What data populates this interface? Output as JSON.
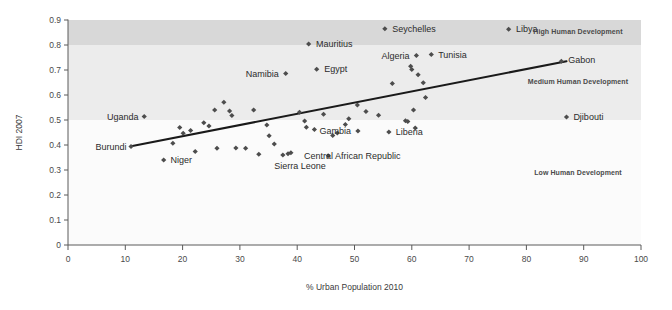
{
  "chart_data": {
    "type": "scatter",
    "title": "",
    "xlabel": "% Urban Population 2010",
    "ylabel": "HDI 2007",
    "xlim": [
      0,
      100
    ],
    "ylim": [
      0,
      0.9
    ],
    "xticks": [
      "0",
      "10",
      "20",
      "30",
      "40",
      "50",
      "60",
      "70",
      "80",
      "90",
      "100"
    ],
    "yticks": [
      "0",
      "0.1",
      "0.2",
      "0.3",
      "0.4",
      "0.5",
      "0.6",
      "0.7",
      "0.8",
      "0.9"
    ],
    "grid": false,
    "legend": "none",
    "marker_color": "#4d4d4d",
    "trendline_color": "#1a1a1a",
    "bands": [
      {
        "name": "High Human Development",
        "label": "High Human Development",
        "y_from": 0.8,
        "y_to": 0.9,
        "color": "#d8d8d8",
        "label_x": 89,
        "label_y": 0.855
      },
      {
        "name": "Medium Human Development",
        "label": "Medium Human Development",
        "y_from": 0.5,
        "y_to": 0.8,
        "color": "#ececec",
        "label_x": 89,
        "label_y": 0.655
      },
      {
        "name": "Low Human Development",
        "label": "Low Human Development",
        "y_from": 0.0,
        "y_to": 0.5,
        "color": "#fbfbfb",
        "label_x": 89,
        "label_y": 0.29
      }
    ],
    "trendline": {
      "x1": 11,
      "y1": 0.395,
      "x2": 87,
      "y2": 0.735
    },
    "labeled_points": [
      {
        "name": "Burundi",
        "x": 11,
        "y": 0.394,
        "label": "Burundi",
        "lx": 10.2,
        "ly": 0.394,
        "anchor": "end"
      },
      {
        "name": "Uganda",
        "x": 13.3,
        "y": 0.514,
        "label": "Uganda",
        "lx": 12.3,
        "ly": 0.514,
        "anchor": "end"
      },
      {
        "name": "Niger",
        "x": 16.7,
        "y": 0.34,
        "label": "Niger",
        "lx": 17.9,
        "ly": 0.34,
        "anchor": "start"
      },
      {
        "name": "Sierra Leone",
        "x": 38.4,
        "y": 0.365,
        "label": "Sierra Leone",
        "lx": 40.5,
        "ly": 0.318,
        "anchor": "middle"
      },
      {
        "name": "Central African Republic",
        "x": 38.9,
        "y": 0.369,
        "label": "Central African Republic",
        "lx": 41.2,
        "ly": 0.356,
        "anchor": "start"
      },
      {
        "name": "Namibia",
        "x": 38.0,
        "y": 0.686,
        "label": "Namibia",
        "lx": 36.8,
        "ly": 0.686,
        "anchor": "end"
      },
      {
        "name": "Egypt",
        "x": 43.4,
        "y": 0.703,
        "label": "Egypt",
        "lx": 44.7,
        "ly": 0.703,
        "anchor": "start"
      },
      {
        "name": "Mauritius",
        "x": 42.0,
        "y": 0.804,
        "label": "Mauritius",
        "lx": 43.3,
        "ly": 0.804,
        "anchor": "start"
      },
      {
        "name": "Seychelles",
        "x": 55.3,
        "y": 0.865,
        "label": "Seychelles",
        "lx": 56.6,
        "ly": 0.865,
        "anchor": "start"
      },
      {
        "name": "Gambia",
        "x": 50.6,
        "y": 0.456,
        "label": "Gambia",
        "lx": 49.4,
        "ly": 0.456,
        "anchor": "end"
      },
      {
        "name": "Liberia",
        "x": 56.0,
        "y": 0.452,
        "label": "Liberia",
        "lx": 57.2,
        "ly": 0.452,
        "anchor": "start"
      },
      {
        "name": "Algeria",
        "x": 60.8,
        "y": 0.758,
        "label": "Algeria",
        "lx": 59.6,
        "ly": 0.758,
        "anchor": "end"
      },
      {
        "name": "Tunisia",
        "x": 63.4,
        "y": 0.762,
        "label": "Tunisia",
        "lx": 64.6,
        "ly": 0.762,
        "anchor": "start"
      },
      {
        "name": "Libya",
        "x": 76.9,
        "y": 0.863,
        "label": "Libya",
        "lx": 78.2,
        "ly": 0.863,
        "anchor": "start"
      },
      {
        "name": "Gabon",
        "x": 86.1,
        "y": 0.735,
        "label": "Gabon",
        "lx": 87.3,
        "ly": 0.742,
        "anchor": "start"
      },
      {
        "name": "Djibouti",
        "x": 87.0,
        "y": 0.512,
        "label": "Djibouti",
        "lx": 88.2,
        "ly": 0.512,
        "anchor": "start"
      }
    ],
    "unlabeled_points": [
      {
        "x": 18.3,
        "y": 0.407
      },
      {
        "x": 19.5,
        "y": 0.47
      },
      {
        "x": 20.1,
        "y": 0.447
      },
      {
        "x": 21.4,
        "y": 0.458
      },
      {
        "x": 22.2,
        "y": 0.374
      },
      {
        "x": 23.7,
        "y": 0.489
      },
      {
        "x": 24.6,
        "y": 0.476
      },
      {
        "x": 25.6,
        "y": 0.54
      },
      {
        "x": 26.0,
        "y": 0.387
      },
      {
        "x": 27.2,
        "y": 0.571
      },
      {
        "x": 28.2,
        "y": 0.536
      },
      {
        "x": 28.6,
        "y": 0.518
      },
      {
        "x": 29.3,
        "y": 0.388
      },
      {
        "x": 31.0,
        "y": 0.387
      },
      {
        "x": 32.4,
        "y": 0.54
      },
      {
        "x": 33.3,
        "y": 0.363
      },
      {
        "x": 34.7,
        "y": 0.48
      },
      {
        "x": 35.1,
        "y": 0.437
      },
      {
        "x": 36.0,
        "y": 0.404
      },
      {
        "x": 37.5,
        "y": 0.36
      },
      {
        "x": 40.4,
        "y": 0.531
      },
      {
        "x": 41.3,
        "y": 0.496
      },
      {
        "x": 41.6,
        "y": 0.471
      },
      {
        "x": 43.0,
        "y": 0.462
      },
      {
        "x": 44.6,
        "y": 0.523
      },
      {
        "x": 45.4,
        "y": 0.357
      },
      {
        "x": 46.2,
        "y": 0.438
      },
      {
        "x": 47.0,
        "y": 0.448
      },
      {
        "x": 48.4,
        "y": 0.482
      },
      {
        "x": 49.0,
        "y": 0.505
      },
      {
        "x": 50.5,
        "y": 0.56
      },
      {
        "x": 52.0,
        "y": 0.534
      },
      {
        "x": 54.2,
        "y": 0.519
      },
      {
        "x": 56.6,
        "y": 0.646
      },
      {
        "x": 58.9,
        "y": 0.497
      },
      {
        "x": 59.3,
        "y": 0.494
      },
      {
        "x": 59.8,
        "y": 0.715
      },
      {
        "x": 60.0,
        "y": 0.702
      },
      {
        "x": 60.3,
        "y": 0.54
      },
      {
        "x": 60.6,
        "y": 0.468
      },
      {
        "x": 61.1,
        "y": 0.681
      },
      {
        "x": 62.0,
        "y": 0.649
      },
      {
        "x": 62.4,
        "y": 0.59
      }
    ]
  }
}
